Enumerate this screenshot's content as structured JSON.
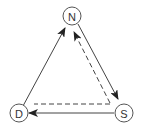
{
  "diagram": {
    "type": "directed-graph",
    "nodes": [
      {
        "id": "N",
        "label": "N",
        "position": "top"
      },
      {
        "id": "D",
        "label": "D",
        "position": "bottom-left"
      },
      {
        "id": "S",
        "label": "S",
        "position": "bottom-right"
      }
    ],
    "edges": [
      {
        "from": "D",
        "to": "N",
        "style": "solid",
        "arrow": true
      },
      {
        "from": "N",
        "to": "S",
        "style": "solid",
        "arrow": true
      },
      {
        "from": "S",
        "to": "N",
        "style": "dashed",
        "arrow": true
      },
      {
        "from": "S",
        "to": "D",
        "style": "solid",
        "arrow": true
      },
      {
        "from": "S",
        "to": "D",
        "style": "dashed",
        "arrow": false
      }
    ],
    "colors": {
      "stroke": "#444444",
      "node_border": "#555555",
      "text": "#333333",
      "background": "#ffffff"
    }
  }
}
